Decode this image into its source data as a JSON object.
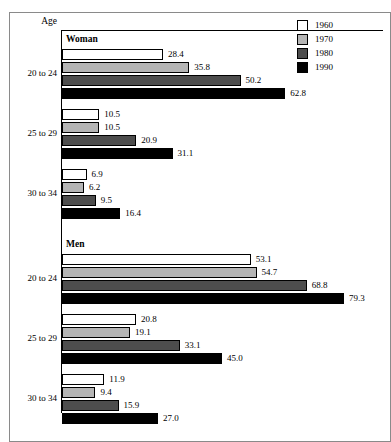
{
  "frame": {
    "axis_title": "Age"
  },
  "legend": {
    "entries": [
      {
        "label": "1960",
        "color": "#ffffff"
      },
      {
        "label": "1970",
        "color": "#b5b5b5"
      },
      {
        "label": "1980",
        "color": "#4d4d4d"
      },
      {
        "label": "1990",
        "color": "#000000"
      }
    ]
  },
  "panels": [
    {
      "title": "Woman",
      "groups": [
        {
          "label": "20 to 24",
          "bars": [
            {
              "series": "1960",
              "value": 28.4,
              "value_label": "28.4",
              "color": "#ffffff"
            },
            {
              "series": "1970",
              "value": 35.8,
              "value_label": "35.8",
              "color": "#b5b5b5"
            },
            {
              "series": "1980",
              "value": 50.2,
              "value_label": "50.2",
              "color": "#4d4d4d"
            },
            {
              "series": "1990",
              "value": 62.8,
              "value_label": "62.8",
              "color": "#000000"
            }
          ]
        },
        {
          "label": "25 to 29",
          "bars": [
            {
              "series": "1960",
              "value": 10.5,
              "value_label": "10.5",
              "color": "#ffffff"
            },
            {
              "series": "1970",
              "value": 10.5,
              "value_label": "10.5",
              "color": "#b5b5b5"
            },
            {
              "series": "1980",
              "value": 20.9,
              "value_label": "20.9",
              "color": "#4d4d4d"
            },
            {
              "series": "1990",
              "value": 31.1,
              "value_label": "31.1",
              "color": "#000000"
            }
          ]
        },
        {
          "label": "30 to 34",
          "bars": [
            {
              "series": "1960",
              "value": 6.9,
              "value_label": "6.9",
              "color": "#ffffff"
            },
            {
              "series": "1970",
              "value": 6.2,
              "value_label": "6.2",
              "color": "#b5b5b5"
            },
            {
              "series": "1980",
              "value": 9.5,
              "value_label": "9.5",
              "color": "#4d4d4d"
            },
            {
              "series": "1990",
              "value": 16.4,
              "value_label": "16.4",
              "color": "#000000"
            }
          ]
        }
      ]
    },
    {
      "title": "Men",
      "groups": [
        {
          "label": "20 to 24",
          "bars": [
            {
              "series": "1960",
              "value": 53.1,
              "value_label": "53.1",
              "color": "#ffffff"
            },
            {
              "series": "1970",
              "value": 54.7,
              "value_label": "54.7",
              "color": "#b5b5b5"
            },
            {
              "series": "1980",
              "value": 68.8,
              "value_label": "68.8",
              "color": "#4d4d4d"
            },
            {
              "series": "1990",
              "value": 79.3,
              "value_label": "79.3",
              "color": "#000000"
            }
          ]
        },
        {
          "label": "25 to 29",
          "bars": [
            {
              "series": "1960",
              "value": 20.8,
              "value_label": "20.8",
              "color": "#ffffff"
            },
            {
              "series": "1970",
              "value": 19.1,
              "value_label": "19.1",
              "color": "#b5b5b5"
            },
            {
              "series": "1980",
              "value": 33.1,
              "value_label": "33.1",
              "color": "#4d4d4d"
            },
            {
              "series": "1990",
              "value": 45.0,
              "value_label": "45.0",
              "color": "#000000"
            }
          ]
        },
        {
          "label": "30 to 34",
          "bars": [
            {
              "series": "1960",
              "value": 11.9,
              "value_label": "11.9",
              "color": "#ffffff"
            },
            {
              "series": "1970",
              "value": 9.4,
              "value_label": "9.4",
              "color": "#b5b5b5"
            },
            {
              "series": "1980",
              "value": 15.9,
              "value_label": "15.9",
              "color": "#4d4d4d"
            },
            {
              "series": "1990",
              "value": 27.0,
              "value_label": "27.0",
              "color": "#000000"
            }
          ]
        }
      ]
    }
  ],
  "chart_data": {
    "type": "bar",
    "orientation": "horizontal",
    "title": "",
    "xlabel": "",
    "ylabel": "Age",
    "xlim": [
      0,
      79.3
    ],
    "grid": false,
    "legend_position": "top-right",
    "legend_entries": [
      "1960",
      "1970",
      "1980",
      "1990"
    ],
    "panels": [
      "Woman",
      "Men"
    ],
    "categories": [
      "20 to 24",
      "25 to 29",
      "30 to 34"
    ],
    "series": [
      {
        "name": "1960",
        "panel": "Woman",
        "values": [
          28.4,
          10.5,
          6.9
        ]
      },
      {
        "name": "1970",
        "panel": "Woman",
        "values": [
          35.8,
          10.5,
          6.2
        ]
      },
      {
        "name": "1980",
        "panel": "Woman",
        "values": [
          50.2,
          20.9,
          9.5
        ]
      },
      {
        "name": "1990",
        "panel": "Woman",
        "values": [
          62.8,
          31.1,
          16.4
        ]
      },
      {
        "name": "1960",
        "panel": "Men",
        "values": [
          53.1,
          20.8,
          11.9
        ]
      },
      {
        "name": "1970",
        "panel": "Men",
        "values": [
          54.7,
          19.1,
          9.4
        ]
      },
      {
        "name": "1980",
        "panel": "Men",
        "values": [
          68.8,
          33.1,
          15.9
        ]
      },
      {
        "name": "1990",
        "panel": "Men",
        "values": [
          79.3,
          45.0,
          27.0
        ]
      }
    ],
    "series_colors": {
      "1960": "#ffffff",
      "1970": "#b5b5b5",
      "1980": "#4d4d4d",
      "1990": "#000000"
    }
  }
}
